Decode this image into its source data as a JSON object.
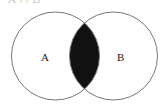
{
  "caption": "A ∩ B",
  "diagram": {
    "type": "venn",
    "sets": [
      {
        "label": "A",
        "cx": 55.5,
        "cy": 56,
        "r": 44
      },
      {
        "label": "B",
        "cx": 113.5,
        "cy": 56,
        "r": 44
      }
    ],
    "shaded_region": "intersection",
    "colors": {
      "stroke": "#777777",
      "fill_shaded": "#111111",
      "background": "#ffffff"
    }
  }
}
